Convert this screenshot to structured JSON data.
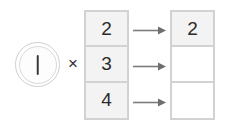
{
  "diagram": {
    "operator": "×",
    "multiplier": {
      "icon": "circled-tally-mark",
      "glyph": "|",
      "value": "1"
    },
    "multiplicand_column": {
      "name": "multiplicand-column",
      "cells": [
        {
          "value": "2",
          "state": "filled"
        },
        {
          "value": "3",
          "state": "filled"
        },
        {
          "value": "4",
          "state": "filled"
        }
      ]
    },
    "arrows": [
      {
        "name": "arrow-row-1",
        "glyph": "→"
      },
      {
        "name": "arrow-row-2",
        "glyph": "→"
      },
      {
        "name": "arrow-row-3",
        "glyph": "→"
      }
    ],
    "product_column": {
      "name": "product-column",
      "cells": [
        {
          "value": "2",
          "state": "filled"
        },
        {
          "value": "",
          "state": "empty"
        },
        {
          "value": "",
          "state": "empty"
        }
      ]
    },
    "colors": {
      "border": "#d2d2d2",
      "cell_fill": "#f3f3f3",
      "cell_empty": "#ffffff",
      "text": "#2b2b2b",
      "arrow": "#7c7c7c",
      "circle_ring": "#cfcfcf",
      "tally": "#3a3a3a",
      "background": "#ffffff"
    }
  }
}
